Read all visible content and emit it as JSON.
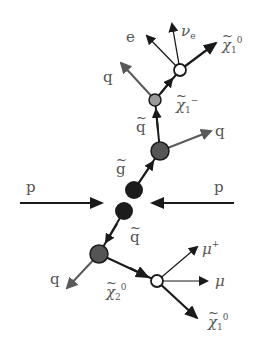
{
  "diagram": {
    "colors": {
      "line_dark": "#1a1a1a",
      "line_grey": "#5a5a5a",
      "node_black": "#1c1c1c",
      "node_dark_grey": "#555555",
      "node_light_grey": "#9a9a9a",
      "node_white": "#ffffff",
      "label": "#555555"
    },
    "nodes": [
      {
        "id": "gluino1",
        "x": 134,
        "y": 190,
        "r": 9,
        "fill": "#1c1c1c"
      },
      {
        "id": "gluino2",
        "x": 124,
        "y": 211,
        "r": 9,
        "fill": "#1c1c1c"
      },
      {
        "id": "squark_up",
        "x": 160,
        "y": 151,
        "r": 9,
        "fill": "#555555"
      },
      {
        "id": "chargino",
        "x": 155,
        "y": 100,
        "r": 6,
        "fill": "#9a9a9a"
      },
      {
        "id": "chargino_decay",
        "x": 180,
        "y": 70,
        "r": 6,
        "fill": "#ffffff"
      },
      {
        "id": "squark_down",
        "x": 99,
        "y": 254,
        "r": 9,
        "fill": "#555555"
      },
      {
        "id": "neutralino2_decay",
        "x": 157,
        "y": 281,
        "r": 6,
        "fill": "#ffffff"
      }
    ],
    "labels": {
      "p_left": "p",
      "p_right": "p",
      "gluino": "g",
      "squark_up": "q",
      "q_up_right": "q",
      "chargino": "χ",
      "chargino_sub": "1",
      "chargino_sup": "−",
      "q_up_left": "q",
      "electron": "e",
      "neutrino": "ν",
      "neutrino_sub": "e",
      "neutralino1_top": "χ",
      "neutralino1_top_sub": "1",
      "neutralino1_top_sup": "0",
      "squark_down": "q",
      "q_down_left": "q",
      "neutralino2": "χ",
      "neutralino2_sub": "2",
      "neutralino2_sup": "0",
      "muon_plus": "μ",
      "muon_plus_sup": "+",
      "muon": "μ",
      "neutralino1_bottom": "χ",
      "neutralino1_bottom_sub": "1",
      "neutralino1_bottom_sup": "0"
    }
  }
}
